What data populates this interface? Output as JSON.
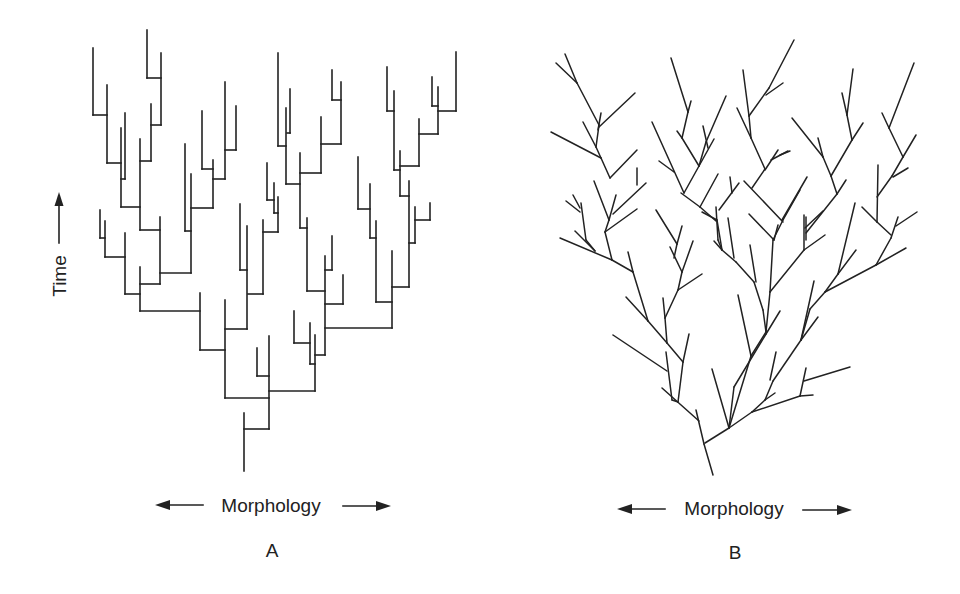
{
  "figure": {
    "panels": [
      {
        "id": "A",
        "label": "A",
        "style": "rectangular branching (punctuated: stasis with abrupt morphological shifts at speciation)",
        "x_axis_label": "Morphology",
        "y_axis_label": "Time",
        "x_axis_arrows": "both-directions",
        "y_axis_arrow": "up"
      },
      {
        "id": "B",
        "label": "B",
        "style": "diagonal branching (gradual morphological change over time)",
        "x_axis_label": "Morphology",
        "x_axis_arrows": "both-directions"
      }
    ]
  },
  "colors": {
    "ink": "#222222",
    "background": "#ffffff"
  }
}
